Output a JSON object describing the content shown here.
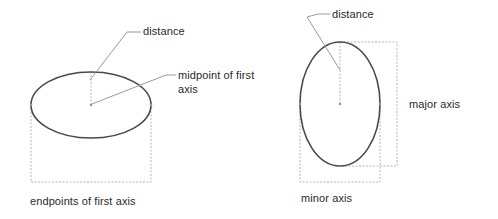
{
  "diagram": {
    "left_figure": {
      "labels": {
        "distance": "distance",
        "midpoint_line1": "midpoint of first",
        "midpoint_line2": "axis",
        "endpoints": "endpoints of first axis"
      },
      "ellipse": {
        "cx": 91,
        "cy": 105,
        "rx": 60,
        "ry": 33
      }
    },
    "right_figure": {
      "labels": {
        "distance": "distance",
        "major_axis": "major axis",
        "minor_axis": "minor axis"
      },
      "ellipse": {
        "cx": 340,
        "cy": 104,
        "rx": 40,
        "ry": 62
      }
    },
    "colors": {
      "ellipse_stroke": "#4a4a4a",
      "leader_line": "#9a9a9a",
      "dimension_line": "#b5b5b5",
      "text": "#2a2a2a"
    }
  }
}
